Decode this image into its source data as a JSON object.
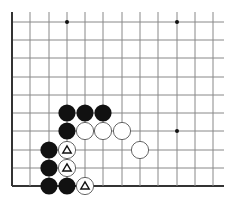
{
  "diagram": {
    "type": "go-board-partial",
    "grid": {
      "left_edge_x": 12,
      "bottom_edge_y": 186,
      "spacing": 18.3,
      "columns_x": [
        12,
        30,
        49,
        67,
        85,
        103,
        122,
        140,
        158,
        177,
        195,
        213
      ],
      "rows_y": [
        22,
        40,
        58,
        77,
        95,
        113,
        131,
        150,
        168,
        186
      ],
      "line_right_end": 224,
      "line_top_start": 12,
      "line_color": "#888888",
      "edge_color": "#333333"
    },
    "star_points": [
      {
        "x": 67,
        "y": 22
      },
      {
        "x": 177,
        "y": 22
      },
      {
        "x": 177,
        "y": 131
      }
    ],
    "stones": [
      {
        "color": "black",
        "x": 67,
        "y": 113
      },
      {
        "color": "black",
        "x": 85,
        "y": 113
      },
      {
        "color": "black",
        "x": 103,
        "y": 113
      },
      {
        "color": "black",
        "x": 67,
        "y": 131
      },
      {
        "color": "white",
        "x": 85,
        "y": 131
      },
      {
        "color": "white",
        "x": 103,
        "y": 131
      },
      {
        "color": "white",
        "x": 122,
        "y": 131
      },
      {
        "color": "black",
        "x": 49,
        "y": 150
      },
      {
        "color": "white",
        "x": 67,
        "y": 150,
        "marker": "triangle"
      },
      {
        "color": "white",
        "x": 140,
        "y": 150
      },
      {
        "color": "black",
        "x": 49,
        "y": 168
      },
      {
        "color": "white",
        "x": 67,
        "y": 168,
        "marker": "triangle"
      },
      {
        "color": "black",
        "x": 49,
        "y": 186
      },
      {
        "color": "black",
        "x": 67,
        "y": 186
      },
      {
        "color": "white",
        "x": 85,
        "y": 186,
        "marker": "triangle"
      }
    ],
    "stone_radius": 8.6,
    "colors": {
      "black_stone": "#111111",
      "white_stone": "#ffffff",
      "white_stone_outline": "#555555",
      "marker": "#111111"
    }
  }
}
